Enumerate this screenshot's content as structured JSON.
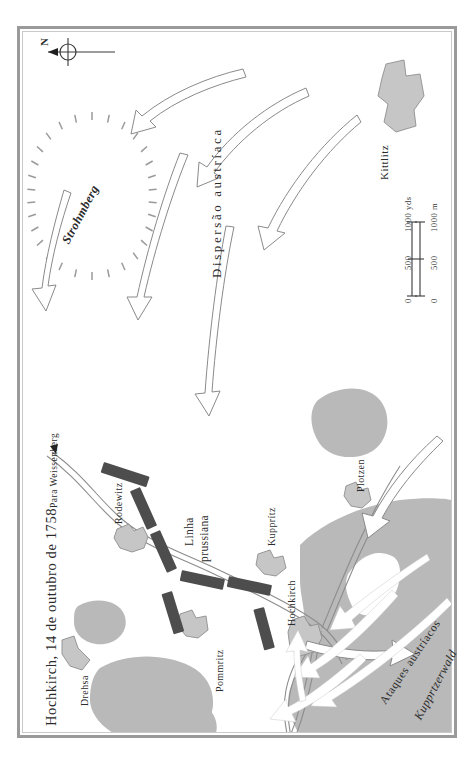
{
  "map": {
    "title": "Hochkirch, 14 de outubro de 1758",
    "orientation_note": "map rotated 90 degrees; north points to the left",
    "compass": {
      "north_letter": "N"
    },
    "colors": {
      "frame": "#9a9a9a",
      "frame_inner": "#c9c9c9",
      "background": "#ffffff",
      "woodland": "#b9b9b9",
      "village": "#c6c6c6",
      "village_outline": "#8f8f8f",
      "troop_block": "#4d4d4d",
      "road": "#8c8c8c",
      "arrow_outline_stroke": "#8a8a8a",
      "arrow_solid_fill": "#ffffff",
      "text": "#2b2b2b"
    },
    "scale_bar": {
      "upper_unit": "1000 yds",
      "lower_unit": "1000 m",
      "upper_ticks": [
        "0",
        "500",
        "1000 yds"
      ],
      "lower_ticks": [
        "0",
        "500",
        "1000 m"
      ]
    },
    "labels": {
      "road_to": "Para Weissenberg",
      "hill": "Strohmberg",
      "forest": "Kupprtzerwald",
      "austrian_dispersal": "Dispersão austríaca",
      "austrian_attacks": "Ataques austríacos",
      "prussian_line_1": "Linha",
      "prussian_line_2": "prussiana"
    },
    "places": [
      {
        "name": "Kittlitz"
      },
      {
        "name": "Rodewitz"
      },
      {
        "name": "Kupprítz"
      },
      {
        "name": "Hochkirch"
      },
      {
        "name": "Plotzen"
      },
      {
        "name": "Pommritz"
      },
      {
        "name": "Drehsa"
      }
    ],
    "legend_semantics": {
      "outline_arrows": "Austrian dispersal / retreat routes (open outline arrows)",
      "solid_arrows": "Austrian attack thrusts (solid white arrows)",
      "dark_blocks": "Prussian line of battle units",
      "hachured_ellipse": "Strohmberg hill (hachure ticks)",
      "gray_blobs": "woodland"
    }
  }
}
